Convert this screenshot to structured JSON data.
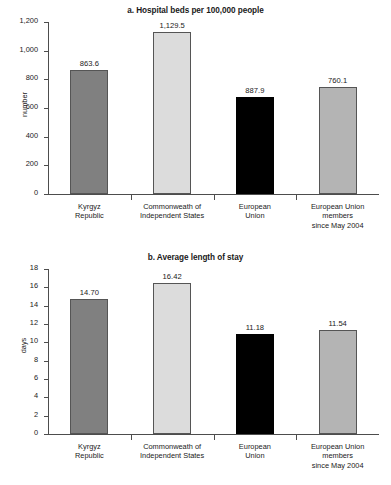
{
  "chart_data": [
    {
      "type": "bar",
      "panel": "a",
      "title": "a. Hospital beds per 100,000 people",
      "xlabel": "",
      "ylabel": "number",
      "ylim": [
        0,
        1200
      ],
      "yticks": [
        0,
        200,
        400,
        600,
        800,
        1000,
        1200
      ],
      "ytick_labels": [
        "0",
        "200",
        "400",
        "600",
        "800",
        "1,000",
        "1,200"
      ],
      "grid": false,
      "legend": "none",
      "categories": [
        "Kyrgyz Republic",
        "Commonweath of Independent States",
        "European Union",
        "European Union members since May 2004"
      ],
      "category_lines": [
        [
          "Kyrgyz",
          "Republic"
        ],
        [
          "Commonweath of",
          "Independent States"
        ],
        [
          "European",
          "Union"
        ],
        [
          "European Union",
          "members",
          "since May 2004"
        ]
      ],
      "values": [
        863.6,
        1129.5,
        887.9,
        760.1
      ],
      "value_labels": [
        "863.6",
        "1,129.5",
        "887.9",
        "760.1"
      ],
      "drawn_bar_tops": [
        863.6,
        1129.5,
        680.0,
        745.0
      ],
      "colors": [
        "#808080",
        "#dcdcdc",
        "#000000",
        "#b4b4b4"
      ]
    },
    {
      "type": "bar",
      "panel": "b",
      "title": "b. Average length of stay",
      "xlabel": "",
      "ylabel": "days",
      "ylim": [
        0,
        18
      ],
      "yticks": [
        0,
        2,
        4,
        6,
        8,
        10,
        12,
        14,
        16,
        18
      ],
      "ytick_labels": [
        "0",
        "2",
        "4",
        "6",
        "8",
        "10",
        "12",
        "14",
        "16",
        "18"
      ],
      "grid": false,
      "legend": "none",
      "categories": [
        "Kyrgyz Republic",
        "Commonweath of Independent States",
        "European Union",
        "European Union members since May 2004"
      ],
      "category_lines": [
        [
          "Kyrgyz",
          "Republic"
        ],
        [
          "Commonweath of",
          "Independent States"
        ],
        [
          "European",
          "Union"
        ],
        [
          "European Union",
          "members",
          "since May 2004"
        ]
      ],
      "values": [
        14.7,
        16.42,
        11.18,
        11.54
      ],
      "value_labels": [
        "14.70",
        "16.42",
        "11.18",
        "11.54"
      ],
      "drawn_bar_tops": [
        14.7,
        16.42,
        10.92,
        11.34
      ],
      "colors": [
        "#808080",
        "#dcdcdc",
        "#000000",
        "#b4b4b4"
      ]
    }
  ]
}
